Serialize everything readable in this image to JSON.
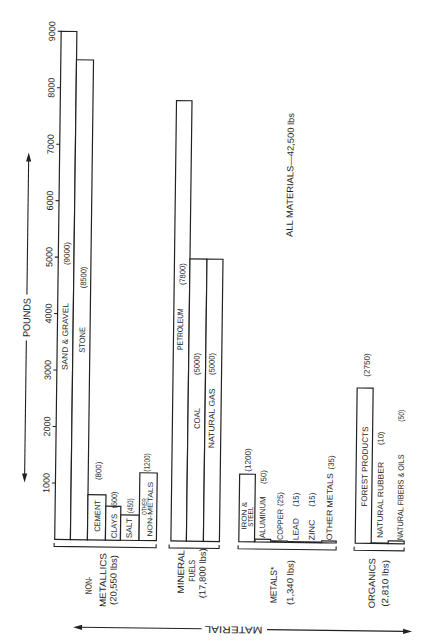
{
  "chart_data": {
    "type": "bar",
    "title": "",
    "orientation": "vertical bars; figure printed rotated 90 degrees",
    "ylabel": "POUNDS",
    "xlabel": "MATERIAL",
    "ylim": [
      0,
      9000
    ],
    "yticks": [
      1000,
      2000,
      3000,
      4000,
      5000,
      6000,
      7000,
      8000,
      9000
    ],
    "ytick_labels": [
      "1000",
      "2000",
      "3000",
      "4000",
      "5000",
      "6000",
      "7000",
      "8000",
      "9000"
    ],
    "grid": false,
    "legend": null,
    "annotation": "ALL MATERIALS—42,500 lbs",
    "groups": [
      {
        "name": "NON-METALLICS",
        "name_lines": [
          "NON-",
          "METALLICS",
          "(20,550 lbs)"
        ],
        "total": 20550,
        "items": [
          {
            "label": "SAND & GRAVEL",
            "value": 9000,
            "value_label": "(9000)"
          },
          {
            "label": "STONE",
            "value": 8500,
            "value_label": "(8500)"
          },
          {
            "label": "CEMENT",
            "value": 800,
            "value_label": "(800)"
          },
          {
            "label": "CLAYS",
            "value": 600,
            "value_label": "(600)"
          },
          {
            "label": "SALT",
            "value": 450,
            "value_label": "(450)"
          },
          {
            "label": "OTHER NON-METALS",
            "label_lines": [
              "OTHER",
              "NON-METALS"
            ],
            "value": 1200,
            "value_label": "(1200)"
          }
        ]
      },
      {
        "name": "MINERAL FUELS",
        "name_lines": [
          "MINERAL",
          "FUELS",
          "(17,800 lbs)"
        ],
        "total": 17800,
        "items": [
          {
            "label": "PETROLEUM",
            "value": 7800,
            "value_label": "(7800)"
          },
          {
            "label": "COAL",
            "value": 5000,
            "value_label": "(5000)"
          },
          {
            "label": "NATURAL GAS",
            "value": 5000,
            "value_label": "(5000)"
          }
        ]
      },
      {
        "name": "METALS*",
        "name_lines": [
          "METALS*",
          "(1,340 lbs)"
        ],
        "total": 1340,
        "items": [
          {
            "label": "IRON & STEEL",
            "label_lines": [
              "IRON &",
              "STEEL"
            ],
            "value": 1200,
            "value_label": "(1200)"
          },
          {
            "label": "ALUMINUM",
            "value": 50,
            "value_label": "(50)"
          },
          {
            "label": "COPPER",
            "value": 25,
            "value_label": "(25)"
          },
          {
            "label": "LEAD",
            "value": 15,
            "value_label": "(15)"
          },
          {
            "label": "ZINC",
            "value": 15,
            "value_label": "(15)"
          },
          {
            "label": "OTHER METALS",
            "value": 35,
            "value_label": "(35)"
          }
        ]
      },
      {
        "name": "ORGANICS",
        "name_lines": [
          "ORGANICS",
          "(2,810 lbs)"
        ],
        "total": 2810,
        "items": [
          {
            "label": "FOREST PRODUCTS",
            "value": 2750,
            "value_label": "(2750)"
          },
          {
            "label": "NATURAL RUBBER",
            "value": 10,
            "value_label": "(10)"
          },
          {
            "label": "NATURAL FIBERS & OILS",
            "value": 50,
            "value_label": "(50)"
          }
        ]
      }
    ],
    "categories": [
      "SAND & GRAVEL",
      "STONE",
      "CEMENT",
      "CLAYS",
      "SALT",
      "OTHER NON-METALS",
      "PETROLEUM",
      "COAL",
      "NATURAL GAS",
      "IRON & STEEL",
      "ALUMINUM",
      "COPPER",
      "LEAD",
      "ZINC",
      "OTHER METALS",
      "FOREST PRODUCTS",
      "NATURAL RUBBER",
      "NATURAL FIBERS & OILS"
    ],
    "values": [
      9000,
      8500,
      800,
      600,
      450,
      1200,
      7800,
      5000,
      5000,
      1200,
      50,
      25,
      15,
      15,
      35,
      2750,
      10,
      50
    ]
  }
}
